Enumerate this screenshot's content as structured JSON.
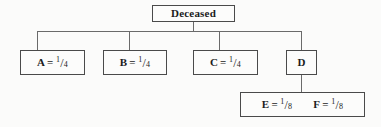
{
  "diagram": {
    "type": "inheritance-distribution-tree",
    "root": {
      "id": "deceased",
      "label": "Deceased"
    },
    "children": [
      {
        "id": "a",
        "name": "A",
        "equals": "=",
        "numerator": "1",
        "solidus": "/",
        "denominator": "4",
        "share": "1/4"
      },
      {
        "id": "b",
        "name": "B",
        "equals": "=",
        "numerator": "1",
        "solidus": "/",
        "denominator": "4",
        "share": "1/4"
      },
      {
        "id": "c",
        "name": "C",
        "equals": "=",
        "numerator": "1",
        "solidus": "/",
        "denominator": "4",
        "share": "1/4"
      },
      {
        "id": "d",
        "name": "D",
        "equals": "",
        "numerator": "",
        "solidus": "",
        "denominator": "",
        "share": ""
      }
    ],
    "grandchildren": [
      {
        "id": "e",
        "name": "E",
        "equals": "=",
        "numerator": "1",
        "solidus": "/",
        "denominator": "8",
        "share": "1/8"
      },
      {
        "id": "f",
        "name": "F",
        "equals": "=",
        "numerator": "1",
        "solidus": "/",
        "denominator": "8",
        "share": "1/8"
      }
    ],
    "colors": {
      "background": "#fbfbfa",
      "box_fill": "#fcfcfb",
      "box_border": "#4a4a4a",
      "connector": "#6a6a6a",
      "text": "#1b1b1b"
    }
  }
}
